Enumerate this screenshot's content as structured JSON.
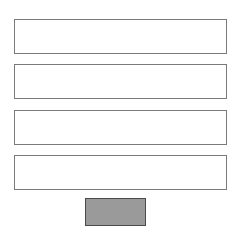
{
  "form": {
    "fields": [
      {
        "value": "",
        "placeholder": ""
      },
      {
        "value": "",
        "placeholder": ""
      },
      {
        "value": "",
        "placeholder": ""
      },
      {
        "value": "",
        "placeholder": ""
      }
    ],
    "submit": {
      "label": ""
    }
  },
  "colors": {
    "background": "#ffffff",
    "field_border": "#7a7a7a",
    "button_fill": "#9a9a9a",
    "button_border": "#4a4a4a"
  }
}
